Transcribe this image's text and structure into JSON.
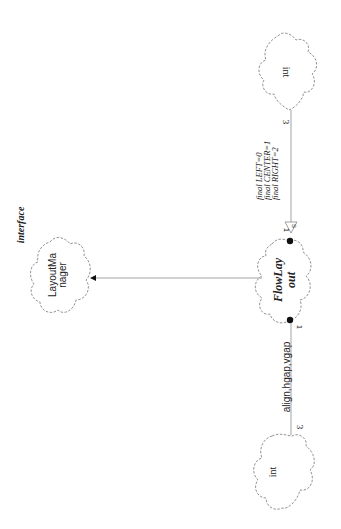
{
  "diagram": {
    "orientation": "rotated-90-clockwise",
    "classes": {
      "flowlayout": {
        "line1": "FlowLay",
        "line2": "out"
      },
      "layoutmanager": {
        "stereotype": "interface",
        "line1": "LayoutMa",
        "line2": "nager"
      },
      "int_top": {
        "label": "int"
      },
      "int_bottom": {
        "label": "int"
      }
    },
    "associations": {
      "constants": {
        "attributes": [
          "final LEFT=0",
          "final CENTER=1",
          "final RIGHT=2"
        ],
        "near_multiplicity": "1",
        "far_multiplicity": "3",
        "marker": "S"
      },
      "fields": {
        "label": "align,hgap,vgap",
        "near_multiplicity": "1",
        "far_multiplicity": "3"
      },
      "implements": {
        "from": "FlowLayout",
        "to": "LayoutManager"
      }
    },
    "colors": {
      "line": "#999999",
      "cloud_stroke": "#777777",
      "text": "#222222",
      "dot": "#111111"
    }
  }
}
